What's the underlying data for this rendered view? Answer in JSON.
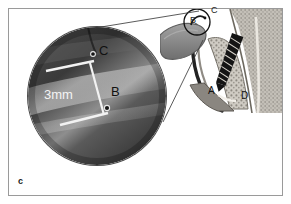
{
  "figure": {
    "panel_letter": "c",
    "border_color": "#9a9a9a",
    "background_color": "#ffffff"
  },
  "magnified_inset": {
    "name": "magnified-circular-inset",
    "measurement_label": "3mm",
    "measurement_color": "#f4f4f4",
    "point_labels": [
      {
        "id": "C",
        "label": "C"
      },
      {
        "id": "B",
        "label": "B"
      }
    ],
    "caliper_color": "#f2f2f2"
  },
  "anatomy_panel": {
    "name": "cross-section-radiograph",
    "labels": [
      {
        "id": "A",
        "label": "A"
      },
      {
        "id": "B",
        "label": "B"
      },
      {
        "id": "C",
        "label": "C"
      },
      {
        "id": "D",
        "label": "D"
      }
    ],
    "roi_marker": "region-of-interest-circle",
    "implant_color": "#1a1a1a",
    "bone_color": "#c8c4bc",
    "tissue_color": "#8d8d8d"
  },
  "leader_lines": {
    "name": "magnifier-leader-lines",
    "count": 2,
    "color": "#3d3d3d"
  }
}
